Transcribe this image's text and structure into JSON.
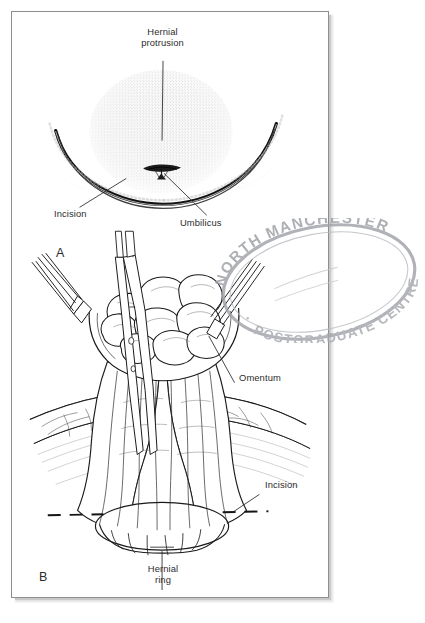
{
  "figure": {
    "panels": [
      {
        "letter": "A",
        "caption": "External view of umbilical hernia with planned curved infraumbilical incision",
        "labels": [
          {
            "name": "hernial-protrusion",
            "text": "Hernial\nprotrusion"
          },
          {
            "name": "incision",
            "text": "Incision"
          },
          {
            "name": "umbilicus",
            "text": "Umbilicus"
          }
        ]
      },
      {
        "letter": "B",
        "caption": "Operative view: hernial sac opened, omentum delivered and held with forceps",
        "labels": [
          {
            "name": "omentum",
            "text": "Omentum"
          },
          {
            "name": "incision",
            "text": "Incision"
          },
          {
            "name": "hernial-ring",
            "text": "Hernial\nring"
          }
        ]
      }
    ]
  },
  "stamp": {
    "top_text": "NORTH MANCHESTER",
    "bottom_text": "POSTGRADUATE CENTRE",
    "color": "#a8aab0"
  },
  "colors": {
    "page_background": "#ffffff",
    "frame_border": "#8d8d8d",
    "frame_shadow": "#c9c9c9",
    "ink": "#1a1a1a",
    "label_text": "#2c2c2c",
    "stipple": "#4a4a4a"
  }
}
